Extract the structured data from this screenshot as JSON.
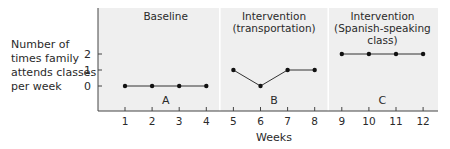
{
  "chart_data": {
    "type": "line",
    "title": "",
    "xlabel": "Weeks",
    "ylabel": [
      "Number of",
      "times family",
      "attends classes",
      "per week"
    ],
    "x": [
      1,
      2,
      3,
      4,
      5,
      6,
      7,
      8,
      9,
      10,
      11,
      12
    ],
    "x_tick_labels": [
      "1",
      "2",
      "3",
      "4",
      "5",
      "6",
      "7",
      "8",
      "9",
      "10",
      "11",
      "12"
    ],
    "y_tick_labels": [
      "0",
      "1",
      "2"
    ],
    "y_ticks": [
      0,
      1,
      2
    ],
    "ylim": [
      -1.5,
      5
    ],
    "grid": false,
    "phases": [
      {
        "name": "Baseline",
        "title_lines": [
          "Baseline"
        ],
        "letter": "A",
        "weeks": [
          1,
          2,
          3,
          4
        ],
        "values": [
          0,
          0,
          0,
          0
        ]
      },
      {
        "name": "Intervention (transportation)",
        "title_lines": [
          "Intervention",
          "(transportation)"
        ],
        "letter": "B",
        "weeks": [
          5,
          6,
          7,
          8
        ],
        "values": [
          1,
          0,
          1,
          1
        ]
      },
      {
        "name": "Intervention (Spanish-speaking class)",
        "title_lines": [
          "Intervention",
          "(Spanish-speaking",
          "class)"
        ],
        "letter": "C",
        "weeks": [
          9,
          10,
          11,
          12
        ],
        "values": [
          2,
          2,
          2,
          2
        ]
      }
    ],
    "colors": {
      "plot_background": "#efefef",
      "phase_divider": "#ffffff",
      "line": "#333333",
      "marker": "#111111",
      "axis": "#444444"
    }
  }
}
